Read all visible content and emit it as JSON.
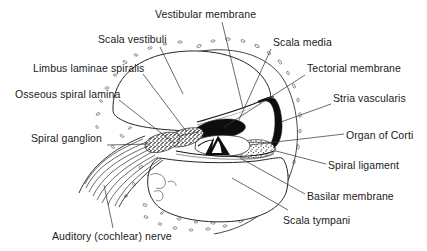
{
  "figure": {
    "type": "anatomical-diagram",
    "background_color": "#ffffff",
    "line_color": "#1a1a1a",
    "text_color": "#1a1a1a",
    "width": 427,
    "height": 251
  },
  "labels": [
    {
      "id": "vestibular-membrane",
      "text": "Vestibular membrane",
      "x": 155,
      "y": 8,
      "side": "top"
    },
    {
      "id": "scala-vestibuli",
      "text": "Scala vestibuli",
      "x": 98,
      "y": 33,
      "side": "top-left"
    },
    {
      "id": "limbus-laminae-spiralis",
      "text": "Limbus laminae spiralis",
      "x": 33,
      "y": 62,
      "side": "left"
    },
    {
      "id": "osseous-spiral-lamina",
      "text": "Osseous spiral lamina",
      "x": 15,
      "y": 88,
      "side": "left"
    },
    {
      "id": "spiral-ganglion",
      "text": "Spiral ganglion",
      "x": 31,
      "y": 132,
      "side": "left"
    },
    {
      "id": "auditory-cochlear-nerve",
      "text": "Auditory (cochlear) nerve",
      "x": 52,
      "y": 230,
      "side": "bottom-left"
    },
    {
      "id": "scala-media",
      "text": "Scala media",
      "x": 273,
      "y": 36,
      "side": "right"
    },
    {
      "id": "tectorial-membrane",
      "text": "Tectorial membrane",
      "x": 307,
      "y": 62,
      "side": "right"
    },
    {
      "id": "stria-vascularis",
      "text": "Stria vascularis",
      "x": 333,
      "y": 92,
      "side": "right"
    },
    {
      "id": "organ-of-corti",
      "text": "Organ of Corti",
      "x": 346,
      "y": 129,
      "side": "right"
    },
    {
      "id": "spiral-ligament",
      "text": "Spiral ligament",
      "x": 328,
      "y": 159,
      "side": "right"
    },
    {
      "id": "basilar-membrane",
      "text": "Basilar membrane",
      "x": 307,
      "y": 190,
      "side": "right"
    },
    {
      "id": "scala-tympani",
      "text": "Scala tympani",
      "x": 283,
      "y": 214,
      "side": "bottom-right"
    }
  ],
  "structures": [
    {
      "id": "scala-vestibuli-chamber",
      "kind": "chamber",
      "fill": "#ffffff"
    },
    {
      "id": "scala-tympani-chamber",
      "kind": "chamber",
      "fill": "#ffffff"
    },
    {
      "id": "scala-media-chamber",
      "kind": "chamber",
      "fill": "#ffffff"
    },
    {
      "id": "bone-matrix",
      "kind": "speckled-bone",
      "fill": "#ffffff"
    },
    {
      "id": "tectorial-membrane-body",
      "kind": "solid-dark",
      "fill": "#101010"
    },
    {
      "id": "stria-vascularis-band",
      "kind": "solid-dark",
      "fill": "#101010"
    },
    {
      "id": "spiral-ganglion-mass",
      "kind": "stippled",
      "fill": "#555555"
    },
    {
      "id": "spiral-ligament-mass",
      "kind": "stippled",
      "fill": "#777777"
    },
    {
      "id": "tunnel-of-corti",
      "kind": "solid-dark",
      "fill": "#101010"
    },
    {
      "id": "nerve-fiber-bundle",
      "kind": "hatched-lines",
      "fill": "none"
    }
  ]
}
